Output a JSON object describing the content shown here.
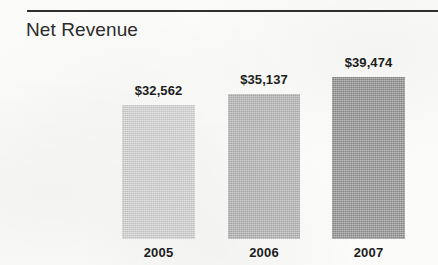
{
  "chart_data": {
    "type": "bar",
    "title": "Net Revenue",
    "xlabel": "",
    "ylabel": "",
    "categories": [
      "2005",
      "2006",
      "2007"
    ],
    "values": [
      32562,
      35137,
      39474
    ],
    "value_labels": [
      "$32,562",
      "$35,137",
      "$39,474"
    ],
    "series": [
      {
        "name": "Net Revenue",
        "values": [
          32562,
          35137,
          39474
        ]
      }
    ],
    "ylim": [
      0,
      43000
    ],
    "grid": false,
    "legend": "none",
    "axis_visible": false,
    "bar_colors": [
      "#d5d5d5",
      "#b3b3b3",
      "#8e8e8e"
    ],
    "currency": "USD",
    "units": "thousands"
  },
  "style": {
    "rule_color": "#2e2e2e",
    "title_color": "#2b2b2b",
    "label_color": "#1d1d1d",
    "background": "#fbfbfa"
  }
}
